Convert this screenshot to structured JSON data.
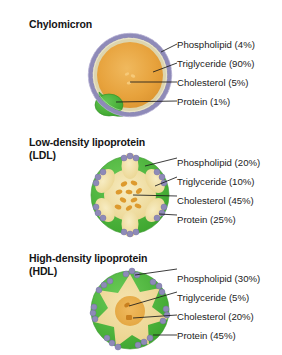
{
  "diagram": {
    "background_color": "#ffffff",
    "colors": {
      "phospholipid_bead": "#8e8ab8",
      "phospholipid_tail": "#d8d2b0",
      "protein_green": "#4cb33c",
      "triglyceride_orange": "#e8a33d",
      "cholesterol_orange": "#d98e28",
      "core_pale_yellow": "#f2e2a8",
      "leader_line": "#1a1a1a",
      "text": "#1a1a1a"
    }
  },
  "panels": [
    {
      "id": "chylomicron",
      "heading": "Chylomicron",
      "particle": {
        "name": "chylomicron-particle",
        "radius": 41,
        "core_fill": "#e8a33d",
        "protein_coverage": "small-single-patch",
        "cholesterol_droplets": 3
      },
      "labels": [
        {
          "name": "phospholipid",
          "text": "Phospholipid (4%)",
          "component": "Phospholipid",
          "percent": 4
        },
        {
          "name": "triglyceride",
          "text": "Triglyceride (90%)",
          "component": "Triglyceride",
          "percent": 90
        },
        {
          "name": "cholesterol",
          "text": "Cholesterol (5%)",
          "component": "Cholesterol",
          "percent": 5
        },
        {
          "name": "protein",
          "text": "Protein (1%)",
          "component": "Protein",
          "percent": 1
        }
      ]
    },
    {
      "id": "ldl",
      "heading": "Low-density lipoprotein\n(LDL)",
      "particle": {
        "name": "ldl-particle",
        "radius": 40,
        "core_fill": "#f2e2a8",
        "protein_coverage": "six-large-patches",
        "cholesterol_droplets": 10
      },
      "labels": [
        {
          "name": "phospholipid",
          "text": "Phospholipid (20%)",
          "component": "Phospholipid",
          "percent": 20
        },
        {
          "name": "triglyceride",
          "text": "Triglyceride (10%)",
          "component": "Triglyceride",
          "percent": 10
        },
        {
          "name": "cholesterol",
          "text": "Cholesterol (45%)",
          "component": "Cholesterol",
          "percent": 45
        },
        {
          "name": "protein",
          "text": "Protein (25%)",
          "component": "Protein",
          "percent": 25
        }
      ]
    },
    {
      "id": "hdl",
      "heading": "High-density lipoprotein\n(HDL)",
      "particle": {
        "name": "hdl-particle",
        "radius": 40,
        "core_fill": "#f0d89a",
        "protein_coverage": "eight-large-patches",
        "cholesterol_droplets": 2
      },
      "labels": [
        {
          "name": "phospholipid",
          "text": "Phospholipid (30%)",
          "component": "Phospholipid",
          "percent": 30
        },
        {
          "name": "triglyceride",
          "text": "Triglyceride (5%)",
          "component": "Triglyceride",
          "percent": 5
        },
        {
          "name": "cholesterol",
          "text": "Cholesterol (20%)",
          "component": "Cholesterol",
          "percent": 20
        },
        {
          "name": "protein",
          "text": "Protein (45%)",
          "component": "Protein",
          "percent": 45
        }
      ]
    }
  ]
}
